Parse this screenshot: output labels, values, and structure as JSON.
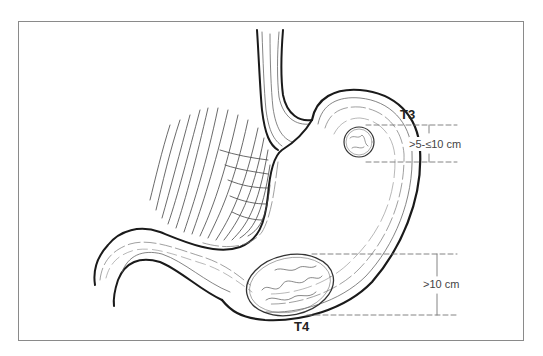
{
  "figure": {
    "stages": [
      {
        "label": "T3",
        "size_label": ">5-≤10 cm"
      },
      {
        "label": "T4",
        "size_label": ">10 cm"
      }
    ]
  },
  "colors": {
    "frame": "#8a8a8a",
    "outline": "#1a1a1a",
    "fold_lines": "#555555",
    "dashed_guides": "#777777"
  }
}
